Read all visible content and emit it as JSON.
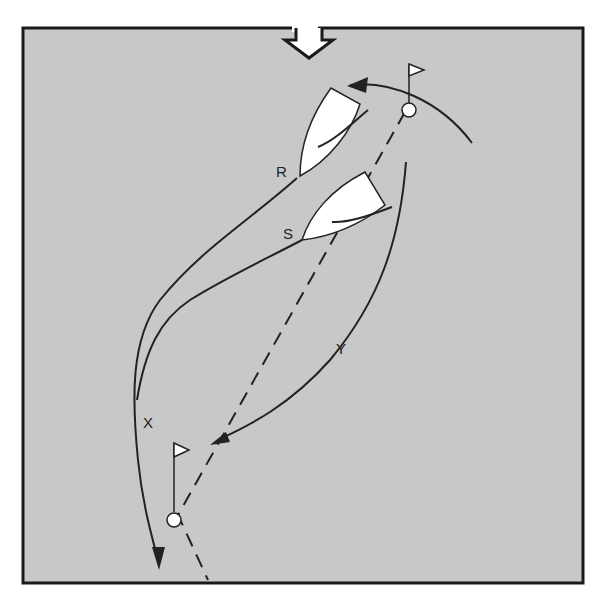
{
  "diagram": {
    "background_color": "#c8c8c8",
    "frame_color": "#1a1a1a",
    "line_color": "#222222",
    "wind_indicator": {
      "icon": "wind-arrow-icon",
      "direction": "down"
    },
    "boats": [
      {
        "id": "R",
        "label": "R"
      },
      {
        "id": "S",
        "label": "S"
      }
    ],
    "marks": [
      {
        "id": "upper",
        "label": "windward-mark"
      },
      {
        "id": "lower",
        "label": "leeward-mark"
      }
    ],
    "tracks": [
      {
        "id": "X",
        "label": "X"
      },
      {
        "id": "Y",
        "label": "Y"
      }
    ]
  }
}
